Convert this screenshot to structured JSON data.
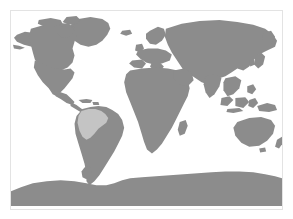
{
  "map": {
    "title": "World Map",
    "projection": "equirectangular",
    "frame_border_color": "#e3e3e3",
    "ocean_color": "#ffffff",
    "land_color": "#8c8c8c",
    "highlight_color": "#c4c4c4",
    "background_color": "#ffffff",
    "legend": [
      {
        "key": "land",
        "label": "Land",
        "color": "#8c8c8c"
      },
      {
        "key": "highlight",
        "label": "Highlighted region",
        "color": "#c4c4c4"
      }
    ],
    "regions": [
      {
        "id": "north-america",
        "label": "North America",
        "state": "land"
      },
      {
        "id": "greenland",
        "label": "Greenland",
        "state": "land"
      },
      {
        "id": "south-america",
        "label": "South America",
        "state": "land"
      },
      {
        "id": "south-america-highlight",
        "label": "Northwestern South America",
        "state": "highlight"
      },
      {
        "id": "europe",
        "label": "Europe",
        "state": "land"
      },
      {
        "id": "africa",
        "label": "Africa",
        "state": "land"
      },
      {
        "id": "asia",
        "label": "Asia",
        "state": "land"
      },
      {
        "id": "australia",
        "label": "Australia",
        "state": "land"
      },
      {
        "id": "new-zealand",
        "label": "New Zealand",
        "state": "land"
      },
      {
        "id": "indonesia",
        "label": "Indonesia",
        "state": "land"
      },
      {
        "id": "japan",
        "label": "Japan",
        "state": "land"
      },
      {
        "id": "madagascar",
        "label": "Madagascar",
        "state": "land"
      },
      {
        "id": "british-isles",
        "label": "British Isles",
        "state": "land"
      },
      {
        "id": "antarctica",
        "label": "Antarctica",
        "state": "land"
      }
    ]
  }
}
